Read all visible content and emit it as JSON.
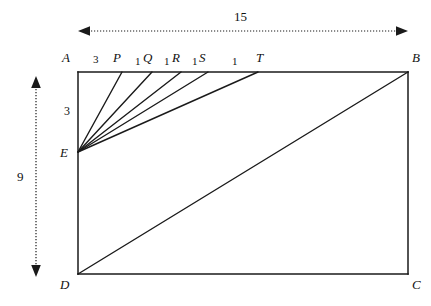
{
  "figure": {
    "type": "plane-geometry-diagram",
    "rectangle": {
      "vertices": [
        {
          "name": "A",
          "label": "A",
          "x": 78,
          "y": 72,
          "label_x": 62,
          "label_y": 51
        },
        {
          "name": "B",
          "label": "B",
          "x": 408,
          "y": 72,
          "label_x": 412,
          "label_y": 51
        },
        {
          "name": "C",
          "label": "C",
          "x": 408,
          "y": 274,
          "label_x": 412,
          "label_y": 278
        },
        {
          "name": "D",
          "label": "D",
          "x": 78,
          "y": 274,
          "label_x": 60,
          "label_y": 278
        }
      ]
    },
    "points": [
      {
        "name": "E",
        "label": "E",
        "x": 78,
        "y": 152,
        "label_x": 60,
        "label_y": 146
      },
      {
        "name": "P",
        "label": "P",
        "x": 122,
        "y": 72,
        "label_x": 113,
        "label_y": 51
      },
      {
        "name": "Q",
        "label": "Q",
        "x": 152,
        "y": 72,
        "label_x": 143,
        "label_y": 51
      },
      {
        "name": "R",
        "label": "R",
        "x": 181,
        "y": 72,
        "label_x": 172,
        "label_y": 51
      },
      {
        "name": "S",
        "label": "S",
        "x": 208,
        "y": 72,
        "label_x": 199,
        "label_y": 51
      },
      {
        "name": "T",
        "label": "T",
        "x": 258,
        "y": 72,
        "label_x": 256,
        "label_y": 51
      }
    ],
    "segment_labels": [
      {
        "name": "AP",
        "value": "3",
        "label_x": 93,
        "label_y": 54
      },
      {
        "name": "PQ",
        "value": "1",
        "label_x": 135,
        "label_y": 56
      },
      {
        "name": "QR",
        "value": "1",
        "label_x": 164,
        "label_y": 56
      },
      {
        "name": "RS",
        "value": "1",
        "label_x": 192,
        "label_y": 56
      },
      {
        "name": "ST",
        "value": "1",
        "label_x": 232,
        "label_y": 56
      }
    ],
    "fan_lines": [
      {
        "name": "E-P",
        "from": "E",
        "to": "P"
      },
      {
        "name": "E-Q",
        "from": "E",
        "to": "Q"
      },
      {
        "name": "E-R",
        "from": "E",
        "to": "R"
      },
      {
        "name": "E-S",
        "from": "E",
        "to": "S"
      },
      {
        "name": "E-T",
        "from": "E",
        "to": "T"
      }
    ],
    "diagonal": {
      "name": "D-B",
      "from": "D",
      "to": "B"
    },
    "dimensions": [
      {
        "name": "width-dimension",
        "value": "15",
        "orientation": "horizontal",
        "x1": 78,
        "y1": 31,
        "x2": 408,
        "y2": 31,
        "label_x": 234,
        "label_y": 10
      },
      {
        "name": "height-dimension",
        "value": "9",
        "orientation": "vertical",
        "x1": 36,
        "y1": 76,
        "x2": 36,
        "y2": 277,
        "label_x": 17,
        "label_y": 170
      },
      {
        "name": "segment-AE-dimension",
        "value": "3",
        "orientation": "vertical-inline",
        "label_x": 64,
        "label_y": 105
      }
    ],
    "style": {
      "stroke_color": "#1a1a1a",
      "background_color": "#ffffff",
      "text_color": "#111111",
      "line_width": 1.4,
      "dimension_line_style": "dotted"
    }
  }
}
